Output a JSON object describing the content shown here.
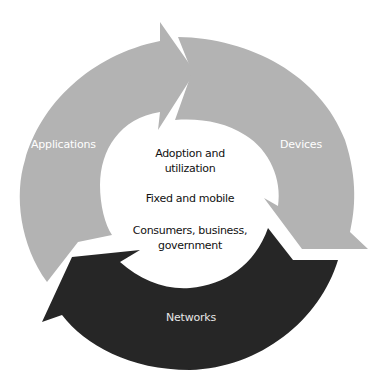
{
  "diagram": {
    "type": "cycle",
    "segments": [
      {
        "label": "Applications",
        "color": "#b3b3b3",
        "label_color": "#ffffff"
      },
      {
        "label": "Devices",
        "color": "#b3b3b3",
        "label_color": "#ffffff"
      },
      {
        "label": "Networks",
        "color": "#262626",
        "label_color": "#e6e6e6"
      }
    ],
    "center": {
      "lines": [
        "Adoption and",
        "utilization",
        "Fixed and mobile",
        "Consumers, business,",
        "government"
      ]
    },
    "background": "#ffffff"
  }
}
